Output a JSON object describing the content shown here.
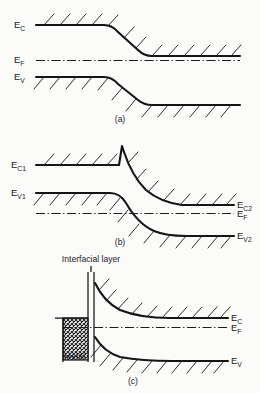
{
  "figure": {
    "background_color": "#fbfbfa",
    "line_color": "#141414"
  },
  "panels": [
    {
      "id": "a",
      "caption": "(a)",
      "description": "Single semiconductor homojunction band bending with step down in conduction and valence bands",
      "labels_left": [
        {
          "name": "conduction-band",
          "base": "E",
          "subscript": "C"
        },
        {
          "name": "fermi-level",
          "base": "E",
          "subscript": "F"
        },
        {
          "name": "valence-band",
          "base": "E",
          "subscript": "V"
        }
      ],
      "labels_right": []
    },
    {
      "id": "b",
      "caption": "(b)",
      "description": "Heterojunction with conduction band spike and notch at the interface",
      "labels_left": [
        {
          "name": "conduction-band-1",
          "base": "E",
          "subscript": "C1"
        },
        {
          "name": "valence-band-1",
          "base": "E",
          "subscript": "V1"
        }
      ],
      "labels_right": [
        {
          "name": "conduction-band-2",
          "base": "E",
          "subscript": "C2"
        },
        {
          "name": "fermi-level",
          "base": "E",
          "subscript": "F"
        },
        {
          "name": "valence-band-2",
          "base": "E",
          "subscript": "V2"
        }
      ]
    },
    {
      "id": "c",
      "caption": "(c)",
      "description": "Metal-semiconductor Schottky contact with interfacial layer",
      "labels_left": [],
      "labels_right": [
        {
          "name": "conduction-band",
          "base": "E",
          "subscript": "C"
        },
        {
          "name": "fermi-level",
          "base": "E",
          "subscript": "F"
        },
        {
          "name": "valence-band",
          "base": "E",
          "subscript": "V"
        }
      ],
      "annotations": [
        {
          "name": "interfacial-layer-label",
          "text": "Interfacial layer"
        },
        {
          "name": "metal-region-label",
          "text": "Metal"
        }
      ]
    }
  ],
  "text": {
    "cap_a": "(a)",
    "cap_b": "(b)",
    "cap_c": "(c)",
    "interfacial_layer": "Interfacial layer",
    "metal": "Metal",
    "E": "E",
    "sub_C": "C",
    "sub_F": "F",
    "sub_V": "V",
    "sub_C1": "C1",
    "sub_V1": "V1",
    "sub_C2": "C2",
    "sub_V2": "V2"
  }
}
